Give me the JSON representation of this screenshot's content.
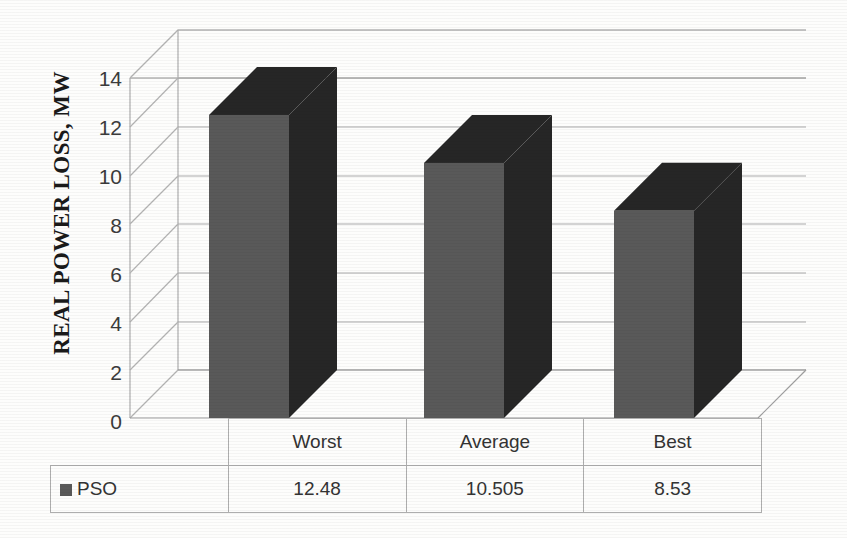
{
  "chart_data": {
    "type": "bar",
    "title": "",
    "xlabel": "",
    "ylabel": "REAL POWER LOSS, MW",
    "categories": [
      "Worst",
      "Average",
      "Best"
    ],
    "values": [
      12.48,
      10.505,
      8.53
    ],
    "series": [
      {
        "name": "PSO",
        "values": [
          12.48,
          10.505,
          8.53
        ]
      }
    ],
    "ylim": [
      0,
      14
    ],
    "ytick_labels": [
      "0",
      "2",
      "4",
      "6",
      "8",
      "10",
      "12",
      "14"
    ],
    "ytick_values": [
      0,
      2,
      4,
      6,
      8,
      10,
      12,
      14
    ],
    "grid": true,
    "legend_position": "data-table-left",
    "three_d": true,
    "colors": {
      "bar_front": "#595959",
      "bar_top": "#262626",
      "bar_side": "#262626",
      "gridline": "#a6a6a6",
      "wall": "#ffffff",
      "text": "#333333"
    }
  },
  "axis": {
    "title": "REAL POWER LOSS, MW",
    "ticks": [
      "14",
      "12",
      "10",
      "8",
      "6",
      "4",
      "2",
      "0"
    ]
  },
  "data_table": {
    "header": [
      "",
      "Worst",
      "Average",
      "Best"
    ],
    "rows": [
      {
        "label": "PSO",
        "cells": [
          "12.48",
          "10.505",
          "8.53"
        ]
      }
    ],
    "col_worst": "Worst",
    "col_average": "Average",
    "col_best": "Best",
    "series_label": "PSO",
    "val_worst": "12.48",
    "val_average": "10.505",
    "val_best": "8.53"
  }
}
